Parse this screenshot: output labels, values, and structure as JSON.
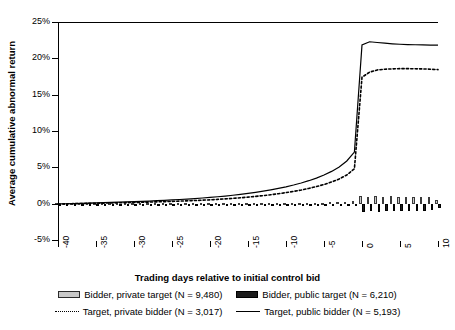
{
  "chart_data": {
    "type": "bar",
    "title": "",
    "subtitle": "",
    "xlabel": "Trading days relative to initial control bid",
    "ylabel": "Average cumulative abnormal return",
    "xlim": [
      -40,
      10
    ],
    "ylim": [
      -0.05,
      0.25
    ],
    "xticks": [
      -40,
      -35,
      -30,
      -25,
      -20,
      -15,
      -10,
      -5,
      0,
      5,
      10
    ],
    "xtick_labels": [
      "-40",
      "-35",
      "-30",
      "-25",
      "-20",
      "-15",
      "-10",
      "-5",
      "0",
      "5",
      "10"
    ],
    "yticks": [
      -0.05,
      0,
      0.05,
      0.1,
      0.15,
      0.2,
      0.25
    ],
    "ytick_labels": [
      "-5%",
      "0%",
      "5%",
      "10%",
      "15%",
      "20%",
      "25%"
    ],
    "grid": false,
    "legend_position": "bottom",
    "x": [
      -40,
      -39,
      -38,
      -37,
      -36,
      -35,
      -34,
      -33,
      -32,
      -31,
      -30,
      -29,
      -28,
      -27,
      -26,
      -25,
      -24,
      -23,
      -22,
      -21,
      -20,
      -19,
      -18,
      -17,
      -16,
      -15,
      -14,
      -13,
      -12,
      -11,
      -10,
      -9,
      -8,
      -7,
      -6,
      -5,
      -4,
      -3,
      -2,
      -1,
      0,
      1,
      2,
      3,
      4,
      5,
      6,
      7,
      8,
      9,
      10
    ],
    "series": [
      {
        "name": "Bidder, private target (N = 9,480)",
        "type": "bar",
        "color": "#c9c9c9",
        "edge_color": "#3a3a3a",
        "values": [
          0.001,
          0.0012,
          0.0008,
          0.0014,
          0.001,
          0.0012,
          0.0009,
          0.0013,
          0.001,
          0.0011,
          0.0012,
          0.001,
          0.0013,
          0.0011,
          0.0009,
          0.0012,
          0.001,
          0.0014,
          0.0011,
          0.0009,
          0.0012,
          0.0013,
          0.001,
          0.0012,
          0.0011,
          0.0013,
          0.001,
          0.0012,
          0.0014,
          0.0011,
          0.0013,
          0.0012,
          0.0014,
          0.0013,
          0.0015,
          0.0016,
          0.0018,
          0.002,
          0.0024,
          0.003,
          0.0105,
          0.0098,
          0.0102,
          0.0095,
          0.0099,
          0.0094,
          0.0096,
          0.0091,
          0.0093,
          0.0088,
          0.0052
        ]
      },
      {
        "name": "Bidder, public target (N = 6,210)",
        "type": "bar",
        "color": "#1c1c1c",
        "edge_color": "#000000",
        "values": [
          -0.0014,
          -0.001,
          -0.0013,
          -0.0009,
          -0.0012,
          -0.001,
          -0.0013,
          -0.0011,
          -0.0012,
          -0.001,
          -0.0013,
          -0.0011,
          -0.001,
          -0.0012,
          -0.0013,
          -0.001,
          -0.0012,
          -0.0011,
          -0.0013,
          -0.0012,
          -0.001,
          -0.0013,
          -0.0012,
          -0.0011,
          -0.0013,
          -0.001,
          -0.0012,
          -0.0013,
          -0.0011,
          -0.0012,
          -0.0013,
          -0.0011,
          -0.0014,
          -0.0012,
          -0.0013,
          -0.0015,
          -0.0014,
          -0.0016,
          -0.0018,
          -0.002,
          -0.0112,
          -0.0104,
          -0.0108,
          -0.0101,
          -0.0105,
          -0.0099,
          -0.0102,
          -0.0096,
          -0.0098,
          -0.0094,
          -0.0058
        ]
      },
      {
        "name": "Target, private bidder (N = 3,017)",
        "type": "line",
        "style": "dotted",
        "color": "#000000",
        "values": [
          -0.0005,
          -0.0003,
          0.0,
          0.0002,
          0.0004,
          0.0006,
          0.0008,
          0.001,
          0.0012,
          0.0014,
          0.0016,
          0.0019,
          0.0022,
          0.0025,
          0.0028,
          0.0031,
          0.0035,
          0.0039,
          0.0043,
          0.0048,
          0.0053,
          0.0059,
          0.0066,
          0.0073,
          0.0081,
          0.009,
          0.01,
          0.0111,
          0.0123,
          0.0137,
          0.0152,
          0.0169,
          0.0188,
          0.021,
          0.0235,
          0.0264,
          0.0298,
          0.034,
          0.0395,
          0.048,
          0.174,
          0.181,
          0.184,
          0.185,
          0.1855,
          0.1858,
          0.1858,
          0.1856,
          0.1854,
          0.185,
          0.1845
        ]
      },
      {
        "name": "Target, public bidder (N = 5,193)",
        "type": "line",
        "style": "solid",
        "color": "#000000",
        "values": [
          -0.0004,
          -0.0001,
          0.0002,
          0.0005,
          0.0008,
          0.0011,
          0.0014,
          0.0017,
          0.002,
          0.0024,
          0.0028,
          0.0032,
          0.0036,
          0.0041,
          0.0046,
          0.0051,
          0.0057,
          0.0063,
          0.007,
          0.0078,
          0.0086,
          0.0095,
          0.0105,
          0.0116,
          0.0128,
          0.0141,
          0.0156,
          0.0172,
          0.019,
          0.021,
          0.0232,
          0.0257,
          0.0285,
          0.0316,
          0.0352,
          0.0394,
          0.0444,
          0.0506,
          0.0588,
          0.071,
          0.2185,
          0.2228,
          0.2218,
          0.2208,
          0.22,
          0.2194,
          0.219,
          0.2187,
          0.2185,
          0.2183,
          0.2182
        ]
      }
    ]
  },
  "legend": {
    "items": [
      {
        "label": "Bidder, private target (N = 9,480)",
        "marker": "private-bar"
      },
      {
        "label": "Bidder, public target (N = 6,210)",
        "marker": "public-bar"
      },
      {
        "label": "Target, private bidder (N = 3,017)",
        "marker": "line-dotted"
      },
      {
        "label": "Target, public bidder (N = 5,193)",
        "marker": "line-solid"
      }
    ]
  }
}
